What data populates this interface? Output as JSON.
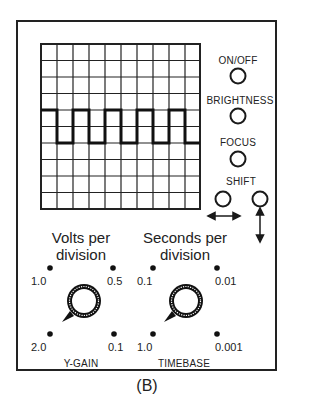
{
  "figure": {
    "caption": "(B)"
  },
  "screen": {
    "grid_columns": 10,
    "grid_rows": 10,
    "waveform": "square-wave",
    "wave_high_row": 4,
    "wave_low_row": 6
  },
  "controls": {
    "on_off": {
      "label": "ON/OFF"
    },
    "brightness": {
      "label": "BRIGHTNESS"
    },
    "focus": {
      "label": "FOCUS"
    },
    "shift": {
      "label": "SHIFT",
      "horizontal_icon": "horizontal-arrow-icon",
      "vertical_icon": "vertical-arrow-icon"
    }
  },
  "y_gain": {
    "title_line1": "Volts per",
    "title_line2": "division",
    "label": "Y-GAIN",
    "positions": [
      "1.0",
      "0.5",
      "2.0",
      "0.1"
    ]
  },
  "timebase": {
    "title_line1": "Seconds per",
    "title_line2": "division",
    "label": "TIMEBASE",
    "positions": [
      "0.1",
      "0.01",
      "1.0",
      "0.001"
    ]
  },
  "colors": {
    "ink": "#1a1a1a",
    "background": "#ffffff"
  }
}
